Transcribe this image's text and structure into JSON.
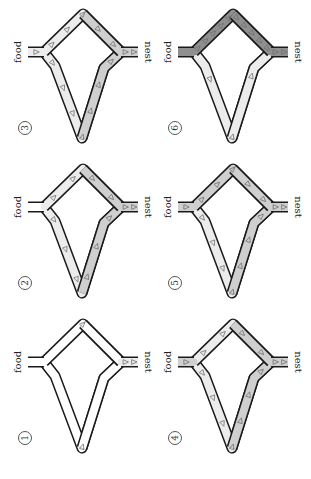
{
  "figure": {
    "labels": {
      "food": "food",
      "nest": "nest"
    },
    "colors": {
      "outline": "#1a1a1a",
      "empty": "#ffffff",
      "light": "#ececec",
      "medium": "#cfcfcf",
      "dark": "#8f8f8f",
      "arrow": "#6e6e6e"
    },
    "panels": [
      {
        "number": "1",
        "short_branch": "empty",
        "long_branch": "empty",
        "nest_stub": "light",
        "food_stub": "empty",
        "short_arrows": 1,
        "long_arrows": 1,
        "stub_arrows": 2
      },
      {
        "number": "2",
        "short_branch": "light",
        "short_branch_near_nest": "medium",
        "long_branch": "light",
        "long_branch_near_nest": "medium",
        "nest_stub": "medium",
        "food_stub": "empty",
        "short_arrows": 4,
        "long_arrows": 6,
        "stub_arrows": 2
      },
      {
        "number": "3",
        "short_branch": "light",
        "short_branch_near_nest": "medium",
        "long_branch": "light",
        "long_branch_near_nest": "medium",
        "nest_stub": "medium",
        "food_stub": "light",
        "short_arrows": 5,
        "long_arrows": 7,
        "stub_arrows": 3
      },
      {
        "number": "4",
        "short_branch": "light",
        "short_branch_near_nest": "medium",
        "long_branch": "light",
        "long_branch_near_nest": "medium",
        "nest_stub": "medium",
        "food_stub": "medium",
        "short_arrows": 4,
        "long_arrows": 7,
        "stub_arrows": 3
      },
      {
        "number": "5",
        "short_branch": "medium",
        "short_branch_near_nest": "medium",
        "long_branch": "light",
        "long_branch_near_nest": "medium",
        "nest_stub": "medium",
        "food_stub": "medium",
        "short_arrows": 5,
        "long_arrows": 7,
        "stub_arrows": 3
      },
      {
        "number": "6",
        "short_branch": "dark",
        "short_branch_near_nest": "dark",
        "long_branch": "light",
        "long_branch_near_nest": "light",
        "nest_stub": "dark",
        "food_stub": "dark",
        "short_arrows": 10,
        "long_arrows": 3,
        "stub_arrows": 2
      }
    ]
  }
}
